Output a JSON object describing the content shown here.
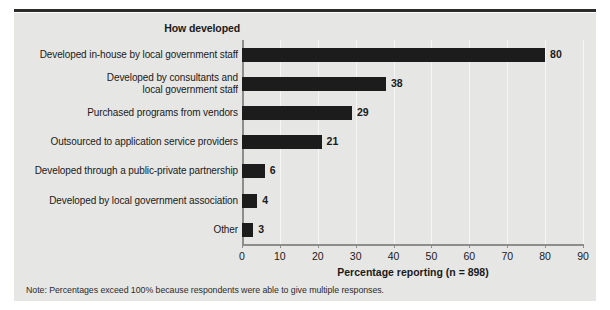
{
  "chart_data": {
    "type": "bar",
    "orientation": "horizontal",
    "title": "How developed",
    "xlabel": "Percentage reporting (n = 898)",
    "ylabel": "",
    "categories": [
      "Developed in-house by local government staff",
      "Developed by consultants and\nlocal government staff",
      "Purchased programs from vendors",
      "Outsourced to application service providers",
      "Developed through a public-private partnership",
      "Developed by local government association",
      "Other"
    ],
    "values": [
      80,
      38,
      29,
      21,
      6,
      4,
      3
    ],
    "value_labels": [
      "80",
      "38",
      "29",
      "21",
      "6",
      "4",
      "3"
    ],
    "xlim": [
      0,
      90
    ],
    "xticks": [
      0,
      10,
      20,
      30,
      40,
      50,
      60,
      70,
      80,
      90
    ],
    "xtick_labels": [
      "0",
      "10",
      "20",
      "30",
      "40",
      "50",
      "60",
      "70",
      "80",
      "90"
    ],
    "grid": "vertical",
    "legend": null,
    "bar_color": "#1c1c1c",
    "background_color": "#e6e6e4",
    "note": "Note: Percentages exceed 100% because respondents were able to give multiple responses."
  },
  "figure": {
    "title": "How developed",
    "axis_caption": "Percentage reporting (n = 898)",
    "note": "Note: Percentages exceed 100% because respondents were able to give multiple responses.",
    "rows": [
      {
        "label_line1": "Developed in-house by local government staff",
        "label_line2": "",
        "value": "80"
      },
      {
        "label_line1": "Developed by consultants and",
        "label_line2": "local government staff",
        "value": "38"
      },
      {
        "label_line1": "Purchased programs from vendors",
        "label_line2": "",
        "value": "29"
      },
      {
        "label_line1": "Outsourced to application service providers",
        "label_line2": "",
        "value": "21"
      },
      {
        "label_line1": "Developed through a public-private partnership",
        "label_line2": "",
        "value": "6"
      },
      {
        "label_line1": "Developed by local government association",
        "label_line2": "",
        "value": "4"
      },
      {
        "label_line1": "Other",
        "label_line2": "",
        "value": "3"
      }
    ],
    "xticks": [
      {
        "label": "0"
      },
      {
        "label": "10"
      },
      {
        "label": "20"
      },
      {
        "label": "30"
      },
      {
        "label": "40"
      },
      {
        "label": "50"
      },
      {
        "label": "60"
      },
      {
        "label": "70"
      },
      {
        "label": "80"
      },
      {
        "label": "90"
      }
    ]
  }
}
